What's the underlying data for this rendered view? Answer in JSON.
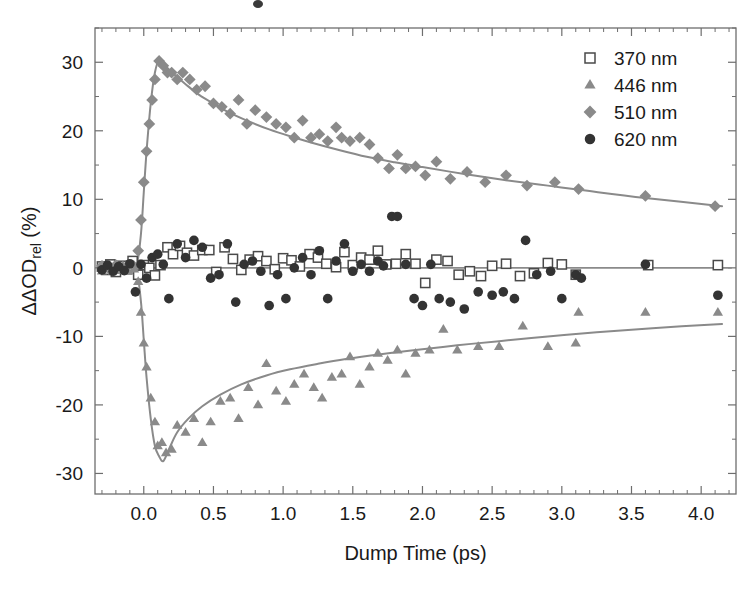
{
  "chart_data": {
    "type": "scatter",
    "title": "",
    "xlabel": "Dump Time (ps)",
    "ylabel": "ΔΔOD_rel (%)",
    "ylabel_parts": {
      "main": "ΔΔOD",
      "sub": "rel",
      "unit": " (%)"
    },
    "xlim": [
      -0.35,
      4.25
    ],
    "ylim": [
      -33,
      35
    ],
    "xticks": [
      0.0,
      0.5,
      1.0,
      1.5,
      2.0,
      2.5,
      3.0,
      3.5,
      4.0
    ],
    "xticklabels": [
      "0.0",
      "0.5",
      "1.0",
      "1.5",
      "2.0",
      "2.5",
      "3.0",
      "3.5",
      "4.0"
    ],
    "yticks": [
      -30,
      -20,
      -10,
      0,
      10,
      20,
      30
    ],
    "yticklabels": [
      "-30",
      "-20",
      "-10",
      "0",
      "10",
      "20",
      "30"
    ],
    "x_minor_step": 0.1,
    "y_minor_step": 5,
    "grid": false,
    "legend_position": "top-right",
    "colors": {
      "marker_370": "#4a4a4a",
      "marker_446": "#8a8a8a",
      "marker_510": "#8a8a8a",
      "marker_620": "#333333",
      "fit_curve": "#8a8a8a",
      "axis": "#6e6e6e",
      "text": "#1a1a1a"
    },
    "series": [
      {
        "name": "370 nm",
        "label": "370 nm",
        "marker": "open-square",
        "color": "#4a4a4a",
        "points": [
          [
            -0.3,
            0.2
          ],
          [
            -0.27,
            -0.3
          ],
          [
            -0.24,
            0.5
          ],
          [
            -0.2,
            -0.6
          ],
          [
            -0.16,
            0.3
          ],
          [
            -0.12,
            -0.2
          ],
          [
            -0.08,
            1.0
          ],
          [
            -0.04,
            -1.0
          ],
          [
            0.0,
            0.4
          ],
          [
            0.04,
            0.0
          ],
          [
            0.08,
            -1.1
          ],
          [
            0.12,
            0.4
          ],
          [
            0.17,
            3.0
          ],
          [
            0.21,
            2.0
          ],
          [
            0.26,
            3.2
          ],
          [
            0.31,
            2.2
          ],
          [
            0.36,
            1.8
          ],
          [
            0.42,
            2.6
          ],
          [
            0.47,
            2.6
          ],
          [
            0.52,
            -0.6
          ],
          [
            0.58,
            3.0
          ],
          [
            0.64,
            1.3
          ],
          [
            0.7,
            -0.3
          ],
          [
            0.76,
            1.2
          ],
          [
            0.82,
            1.7
          ],
          [
            0.88,
            1.0
          ],
          [
            0.94,
            -0.2
          ],
          [
            1.0,
            1.4
          ],
          [
            1.06,
            1.1
          ],
          [
            1.12,
            0.2
          ],
          [
            1.19,
            2.0
          ],
          [
            1.25,
            1.5
          ],
          [
            1.31,
            0.6
          ],
          [
            1.38,
            0.1
          ],
          [
            1.44,
            2.3
          ],
          [
            1.5,
            0.4
          ],
          [
            1.56,
            1.5
          ],
          [
            1.62,
            1.2
          ],
          [
            1.68,
            2.5
          ],
          [
            1.74,
            0.5
          ],
          [
            1.81,
            0.6
          ],
          [
            1.88,
            2.0
          ],
          [
            1.95,
            0.6
          ],
          [
            2.02,
            -2.2
          ],
          [
            2.1,
            1.2
          ],
          [
            2.18,
            1.0
          ],
          [
            2.26,
            -1.0
          ],
          [
            2.34,
            -0.5
          ],
          [
            2.42,
            -1.2
          ],
          [
            2.5,
            0.3
          ],
          [
            2.6,
            0.6
          ],
          [
            2.7,
            -1.2
          ],
          [
            2.8,
            -0.8
          ],
          [
            2.9,
            0.7
          ],
          [
            3.0,
            0.5
          ],
          [
            3.1,
            -1.0
          ],
          [
            3.62,
            0.4
          ],
          [
            4.12,
            0.4
          ]
        ]
      },
      {
        "name": "446 nm",
        "label": "446 nm",
        "marker": "triangle",
        "color": "#8a8a8a",
        "points": [
          [
            -0.3,
            -0.5
          ],
          [
            -0.25,
            0.2
          ],
          [
            -0.2,
            -0.4
          ],
          [
            -0.15,
            0.3
          ],
          [
            -0.11,
            -0.5
          ],
          [
            -0.07,
            -0.2
          ],
          [
            -0.04,
            -2.0
          ],
          [
            -0.02,
            -6.5
          ],
          [
            0.0,
            -11.0
          ],
          [
            0.02,
            -14.5
          ],
          [
            0.05,
            -19.0
          ],
          [
            0.08,
            -22.5
          ],
          [
            0.1,
            -26.0
          ],
          [
            0.13,
            -25.5
          ],
          [
            0.16,
            -27.0
          ],
          [
            0.2,
            -26.5
          ],
          [
            0.24,
            -23.0
          ],
          [
            0.3,
            -24.0
          ],
          [
            0.36,
            -22.0
          ],
          [
            0.42,
            -25.5
          ],
          [
            0.48,
            -22.5
          ],
          [
            0.55,
            -19.5
          ],
          [
            0.62,
            -19.0
          ],
          [
            0.68,
            -22.0
          ],
          [
            0.75,
            -17.5
          ],
          [
            0.82,
            -20.0
          ],
          [
            0.88,
            -14.0
          ],
          [
            0.95,
            -18.0
          ],
          [
            1.02,
            -19.5
          ],
          [
            1.08,
            -17.0
          ],
          [
            1.15,
            -15.5
          ],
          [
            1.22,
            -17.5
          ],
          [
            1.28,
            -19.0
          ],
          [
            1.35,
            -16.0
          ],
          [
            1.42,
            -15.5
          ],
          [
            1.48,
            -13.0
          ],
          [
            1.55,
            -17.0
          ],
          [
            1.62,
            -14.5
          ],
          [
            1.68,
            -12.5
          ],
          [
            1.75,
            -13.5
          ],
          [
            1.82,
            -12.0
          ],
          [
            1.88,
            -15.5
          ],
          [
            1.95,
            -12.5
          ],
          [
            2.05,
            -12.0
          ],
          [
            2.15,
            -9.0
          ],
          [
            2.25,
            -12.0
          ],
          [
            2.4,
            -11.5
          ],
          [
            2.55,
            -11.5
          ],
          [
            2.72,
            -8.5
          ],
          [
            2.9,
            -11.5
          ],
          [
            3.1,
            -11.0
          ],
          [
            3.12,
            -6.5
          ],
          [
            3.6,
            -6.5
          ],
          [
            4.12,
            -6.5
          ]
        ]
      },
      {
        "name": "510 nm",
        "label": "510 nm",
        "marker": "diamond",
        "color": "#8a8a8a",
        "points": [
          [
            -0.3,
            0.3
          ],
          [
            -0.25,
            -0.2
          ],
          [
            -0.2,
            0.4
          ],
          [
            -0.15,
            0.0
          ],
          [
            -0.11,
            0.5
          ],
          [
            -0.07,
            0.2
          ],
          [
            -0.04,
            2.5
          ],
          [
            -0.02,
            7.0
          ],
          [
            0.0,
            12.5
          ],
          [
            0.02,
            17.0
          ],
          [
            0.04,
            21.0
          ],
          [
            0.06,
            24.5
          ],
          [
            0.08,
            27.5
          ],
          [
            0.11,
            30.2
          ],
          [
            0.14,
            29.5
          ],
          [
            0.17,
            28.5
          ],
          [
            0.2,
            28.5
          ],
          [
            0.24,
            27.5
          ],
          [
            0.28,
            28.5
          ],
          [
            0.33,
            27.5
          ],
          [
            0.38,
            26.0
          ],
          [
            0.44,
            26.5
          ],
          [
            0.5,
            24.0
          ],
          [
            0.56,
            23.5
          ],
          [
            0.62,
            22.5
          ],
          [
            0.68,
            24.5
          ],
          [
            0.74,
            21.0
          ],
          [
            0.8,
            23.0
          ],
          [
            0.88,
            22.0
          ],
          [
            0.95,
            21.0
          ],
          [
            1.02,
            20.5
          ],
          [
            1.08,
            19.0
          ],
          [
            1.14,
            21.5
          ],
          [
            1.2,
            19.0
          ],
          [
            1.26,
            19.5
          ],
          [
            1.32,
            18.5
          ],
          [
            1.38,
            20.5
          ],
          [
            1.42,
            19.0
          ],
          [
            1.48,
            18.5
          ],
          [
            1.55,
            19.0
          ],
          [
            1.62,
            18.0
          ],
          [
            1.68,
            16.0
          ],
          [
            1.76,
            14.5
          ],
          [
            1.82,
            16.5
          ],
          [
            1.88,
            14.5
          ],
          [
            1.95,
            14.8
          ],
          [
            2.02,
            13.5
          ],
          [
            2.1,
            15.5
          ],
          [
            2.2,
            13.0
          ],
          [
            2.32,
            14.0
          ],
          [
            2.45,
            12.5
          ],
          [
            2.6,
            13.5
          ],
          [
            2.75,
            12.0
          ],
          [
            2.95,
            12.5
          ],
          [
            3.12,
            11.5
          ],
          [
            3.6,
            10.5
          ],
          [
            4.1,
            9.0
          ]
        ]
      },
      {
        "name": "620 nm",
        "label": "620 nm",
        "marker": "circle",
        "color": "#333333",
        "points": [
          [
            -0.3,
            -0.3
          ],
          [
            -0.26,
            0.4
          ],
          [
            -0.22,
            -0.5
          ],
          [
            -0.18,
            0.2
          ],
          [
            -0.14,
            -0.4
          ],
          [
            -0.1,
            0.6
          ],
          [
            -0.06,
            -3.5
          ],
          [
            -0.02,
            0.5
          ],
          [
            0.02,
            -1.5
          ],
          [
            0.06,
            1.5
          ],
          [
            0.1,
            2.0
          ],
          [
            0.14,
            0.5
          ],
          [
            0.18,
            -4.5
          ],
          [
            0.24,
            3.5
          ],
          [
            0.3,
            1.5
          ],
          [
            0.36,
            4.0
          ],
          [
            0.42,
            3.0
          ],
          [
            0.48,
            -1.5
          ],
          [
            0.54,
            -1.0
          ],
          [
            0.6,
            3.5
          ],
          [
            0.66,
            -5.0
          ],
          [
            0.72,
            0.5
          ],
          [
            0.78,
            1.0
          ],
          [
            0.84,
            -0.5
          ],
          [
            0.9,
            -5.5
          ],
          [
            0.96,
            -1.0
          ],
          [
            1.02,
            -4.5
          ],
          [
            1.08,
            0.0
          ],
          [
            1.14,
            1.5
          ],
          [
            1.2,
            -1.0
          ],
          [
            1.26,
            2.5
          ],
          [
            1.32,
            -4.5
          ],
          [
            1.38,
            1.0
          ],
          [
            1.44,
            3.5
          ],
          [
            1.5,
            -0.5
          ],
          [
            1.56,
            0.5
          ],
          [
            1.62,
            -0.5
          ],
          [
            1.68,
            1.0
          ],
          [
            1.72,
            0.3
          ],
          [
            1.78,
            7.5
          ],
          [
            1.82,
            7.5
          ],
          [
            1.88,
            0.5
          ],
          [
            1.94,
            -4.5
          ],
          [
            2.0,
            -5.5
          ],
          [
            2.06,
            0.5
          ],
          [
            2.12,
            -4.5
          ],
          [
            2.2,
            -5.0
          ],
          [
            2.3,
            -6.0
          ],
          [
            2.4,
            -3.5
          ],
          [
            2.5,
            -4.0
          ],
          [
            2.58,
            -3.5
          ],
          [
            2.66,
            -4.5
          ],
          [
            2.74,
            4.0
          ],
          [
            2.82,
            -1.0
          ],
          [
            2.92,
            -0.5
          ],
          [
            3.0,
            -4.5
          ],
          [
            3.1,
            -1.0
          ],
          [
            3.14,
            -1.5
          ],
          [
            3.6,
            0.5
          ],
          [
            4.12,
            -4.0
          ]
        ]
      }
    ],
    "fit_curves": [
      {
        "name": "510 nm fit",
        "for_series": "510 nm",
        "points": [
          [
            -0.33,
            -0.2
          ],
          [
            -0.1,
            -0.2
          ],
          [
            -0.05,
            0.5
          ],
          [
            -0.02,
            5.0
          ],
          [
            0.0,
            11.0
          ],
          [
            0.02,
            17.0
          ],
          [
            0.05,
            24.0
          ],
          [
            0.08,
            28.5
          ],
          [
            0.11,
            30.2
          ],
          [
            0.16,
            29.3
          ],
          [
            0.22,
            28.2
          ],
          [
            0.3,
            26.8
          ],
          [
            0.4,
            25.2
          ],
          [
            0.5,
            24.0
          ],
          [
            0.6,
            22.8
          ],
          [
            0.75,
            21.4
          ],
          [
            0.9,
            20.2
          ],
          [
            1.05,
            19.2
          ],
          [
            1.2,
            18.3
          ],
          [
            1.4,
            17.2
          ],
          [
            1.6,
            16.2
          ],
          [
            1.8,
            15.4
          ],
          [
            2.0,
            14.7
          ],
          [
            2.3,
            13.7
          ],
          [
            2.6,
            12.8
          ],
          [
            2.9,
            12.0
          ],
          [
            3.2,
            11.2
          ],
          [
            3.6,
            10.2
          ],
          [
            4.15,
            9.0
          ]
        ]
      },
      {
        "name": "446 nm fit",
        "for_series": "446 nm",
        "points": [
          [
            -0.33,
            0.2
          ],
          [
            -0.1,
            0.2
          ],
          [
            -0.05,
            -0.5
          ],
          [
            -0.02,
            -5.0
          ],
          [
            0.0,
            -10.5
          ],
          [
            0.02,
            -16.0
          ],
          [
            0.05,
            -22.0
          ],
          [
            0.08,
            -26.0
          ],
          [
            0.11,
            -27.5
          ],
          [
            0.14,
            -28.2
          ],
          [
            0.18,
            -26.5
          ],
          [
            0.24,
            -24.0
          ],
          [
            0.32,
            -22.0
          ],
          [
            0.42,
            -20.2
          ],
          [
            0.55,
            -18.5
          ],
          [
            0.7,
            -17.0
          ],
          [
            0.88,
            -15.7
          ],
          [
            1.05,
            -14.8
          ],
          [
            1.25,
            -14.0
          ],
          [
            1.45,
            -13.3
          ],
          [
            1.7,
            -12.6
          ],
          [
            1.95,
            -12.0
          ],
          [
            2.25,
            -11.3
          ],
          [
            2.55,
            -10.7
          ],
          [
            2.9,
            -10.0
          ],
          [
            3.25,
            -9.4
          ],
          [
            3.65,
            -8.8
          ],
          [
            4.15,
            -8.2
          ]
        ]
      },
      {
        "name": "zero baseline",
        "for_series": "370 nm",
        "points": [
          [
            -0.33,
            0.0
          ],
          [
            4.22,
            0.0
          ]
        ]
      }
    ]
  },
  "legend": {
    "entries": [
      {
        "label": "370 nm",
        "marker": "open-square"
      },
      {
        "label": "446 nm",
        "marker": "triangle"
      },
      {
        "label": "510 nm",
        "marker": "diamond"
      },
      {
        "label": "620 nm",
        "marker": "circle"
      }
    ]
  }
}
